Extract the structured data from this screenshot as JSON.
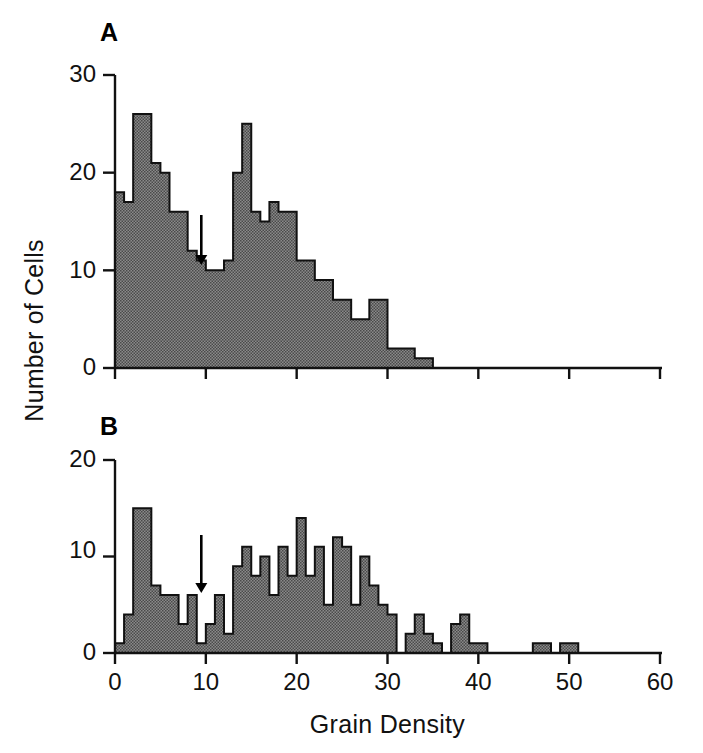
{
  "figure": {
    "xlabel": "Grain Density",
    "ylabel": "Number of Cells",
    "panel_a_letter": "A",
    "panel_b_letter": "B",
    "ink_color": "#111111",
    "fill_color": "#7c7c7c",
    "background": "#ffffff"
  },
  "axes": {
    "x_ticks": [
      "0",
      "10",
      "20",
      "30",
      "40",
      "50",
      "60"
    ],
    "panel_a_y_ticks": [
      "0",
      "10",
      "20",
      "30"
    ],
    "panel_b_y_ticks": [
      "0",
      "10",
      "20"
    ]
  },
  "chart_data": [
    {
      "type": "bar",
      "panel": "A",
      "title": "A",
      "xlabel": "Grain Density",
      "ylabel": "Number of Cells",
      "xlim": [
        0,
        60
      ],
      "ylim": [
        0,
        30
      ],
      "bin_width": 1,
      "grid": false,
      "legend": false,
      "annotation": {
        "marker": "down-arrow",
        "x": 9,
        "label": ""
      },
      "bin_starts": [
        0,
        1,
        2,
        3,
        4,
        5,
        6,
        7,
        8,
        9,
        10,
        11,
        12,
        13,
        14,
        15,
        16,
        17,
        18,
        19,
        20,
        21,
        22,
        23,
        24,
        25,
        26,
        27,
        28,
        29,
        30,
        31,
        32,
        33,
        34,
        35,
        36,
        37,
        38,
        39,
        40
      ],
      "values": [
        18,
        17,
        26,
        26,
        21,
        20,
        16,
        16,
        12,
        11,
        10,
        10,
        11,
        20,
        25,
        16,
        15,
        17,
        16,
        16,
        11,
        11,
        9,
        9,
        7,
        7,
        5,
        5,
        7,
        7,
        2,
        2,
        2,
        1,
        1,
        0,
        0,
        0,
        0,
        0,
        0
      ]
    },
    {
      "type": "bar",
      "panel": "B",
      "title": "B",
      "xlabel": "Grain Density",
      "ylabel": "Number of Cells",
      "xlim": [
        0,
        60
      ],
      "ylim": [
        0,
        20
      ],
      "bin_width": 1,
      "grid": false,
      "legend": false,
      "annotation": {
        "marker": "down-arrow",
        "x": 9,
        "label": ""
      },
      "bin_starts": [
        0,
        1,
        2,
        3,
        4,
        5,
        6,
        7,
        8,
        9,
        10,
        11,
        12,
        13,
        14,
        15,
        16,
        17,
        18,
        19,
        20,
        21,
        22,
        23,
        24,
        25,
        26,
        27,
        28,
        29,
        30,
        31,
        32,
        33,
        34,
        35,
        36,
        37,
        38,
        39,
        40,
        41,
        42,
        43,
        44,
        45,
        46,
        47,
        48,
        49,
        50,
        51,
        52,
        53,
        54,
        55,
        56,
        57,
        58,
        59
      ],
      "values": [
        1,
        4,
        15,
        15,
        7,
        6,
        6,
        3,
        6,
        1,
        3,
        6,
        2,
        9,
        11,
        8,
        10,
        6,
        11,
        8,
        14,
        8,
        11,
        5,
        12,
        11,
        5,
        10,
        7,
        5,
        4,
        0,
        2,
        4,
        2,
        1,
        0,
        3,
        4,
        1,
        1,
        0,
        0,
        0,
        0,
        0,
        1,
        1,
        0,
        1,
        1,
        0,
        0,
        0,
        0,
        0,
        0,
        0,
        0,
        0
      ]
    }
  ]
}
